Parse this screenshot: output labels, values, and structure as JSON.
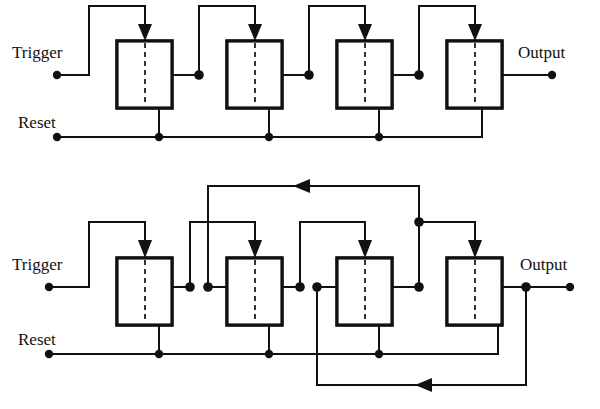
{
  "figure": {
    "colors": {
      "wire": "#111111",
      "box_stroke": "#111111",
      "box_fill": "#ffffff",
      "hatch": "#111111",
      "background": "#ffffff"
    }
  },
  "circuits": [
    {
      "id": "top-circuit",
      "name": "four-stage-ripple-counter",
      "labels": {
        "trigger": "Trigger",
        "reset": "Reset",
        "output": "Output"
      },
      "stage_count": 4,
      "stages": [
        {
          "index": 1,
          "name": "flip-flop-1"
        },
        {
          "index": 2,
          "name": "flip-flop-2"
        },
        {
          "index": 3,
          "name": "flip-flop-3"
        },
        {
          "index": 4,
          "name": "flip-flop-4"
        }
      ]
    },
    {
      "id": "bottom-circuit",
      "name": "four-stage-ripple-counter-with-feedback",
      "labels": {
        "trigger": "Trigger",
        "reset": "Reset",
        "output": "Output"
      },
      "stage_count": 4,
      "stages": [
        {
          "index": 1,
          "name": "flip-flop-1"
        },
        {
          "index": 2,
          "name": "flip-flop-2"
        },
        {
          "index": 3,
          "name": "flip-flop-3"
        },
        {
          "index": 4,
          "name": "flip-flop-4"
        }
      ]
    }
  ]
}
